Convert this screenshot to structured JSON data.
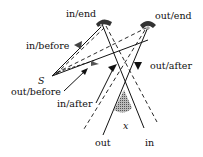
{
  "diagram": {
    "labels": {
      "in_end": "in/end",
      "out_end": "out/end",
      "in_before": "in/before",
      "out_before": "out/before",
      "in_after": "in/after",
      "out_after": "out/after",
      "source": "S",
      "angle": "x",
      "out": "out",
      "in": "in"
    },
    "colors": {
      "line": "#111111",
      "wedge_fill": "#9a9a9a",
      "mirror_fill": "#333333",
      "background": "#ffffff"
    }
  }
}
